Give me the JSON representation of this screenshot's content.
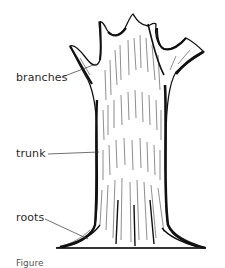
{
  "diagram": {
    "labels": [
      {
        "id": "branches",
        "text": "branches",
        "x": 16,
        "y": 74,
        "line": [
          62,
          77,
          96,
          64
        ]
      },
      {
        "id": "trunk",
        "text": "trunk",
        "x": 16,
        "y": 148,
        "line": [
          48,
          154,
          99,
          152
        ]
      },
      {
        "id": "roots",
        "text": "roots",
        "x": 16,
        "y": 212,
        "line": [
          45,
          219,
          88,
          239
        ]
      }
    ],
    "caption": "Figure"
  },
  "colors": {
    "ink": "#111111",
    "label": "#2a2a2a",
    "background": "#ffffff"
  }
}
